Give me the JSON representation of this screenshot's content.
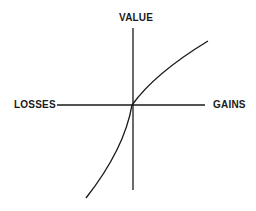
{
  "diagram": {
    "labels": {
      "y_axis": "VALUE",
      "x_negative": "LOSSES",
      "x_positive": "GAINS"
    },
    "colors": {
      "ink": "#1a1a1a",
      "background": "#ffffff"
    },
    "curve": {
      "description": "S-shaped value function: concave for gains, convex and steeper for losses",
      "gains_end": [
        208,
        41
      ],
      "origin": [
        132,
        105
      ],
      "losses_end": [
        86,
        198
      ]
    }
  }
}
